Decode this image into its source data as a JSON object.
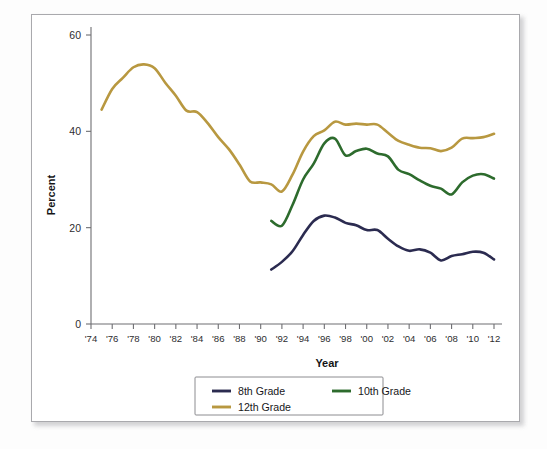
{
  "page": {
    "clipped_header_text": ""
  },
  "chart_data": {
    "type": "line",
    "title": "",
    "xlabel": "Year",
    "ylabel": "Percent",
    "ylim": [
      0,
      60
    ],
    "yticks": [
      0,
      20,
      40,
      60
    ],
    "ytick_labels": [
      "0",
      "20",
      "40",
      "60"
    ],
    "xlim": [
      1974,
      2012
    ],
    "xticks": [
      1974,
      1976,
      1978,
      1980,
      1982,
      1984,
      1986,
      1988,
      1990,
      1992,
      1994,
      1996,
      1998,
      2000,
      2002,
      2004,
      2006,
      2008,
      2010,
      2012
    ],
    "xtick_labels": [
      "'74",
      "'76",
      "'78",
      "'80",
      "'82",
      "'84",
      "'86",
      "'88",
      "'90",
      "'92",
      "'94",
      "'96",
      "'98",
      "'00",
      "'02",
      "'04",
      "'06",
      "'08",
      "'10",
      "'12"
    ],
    "grid": false,
    "legend_position": "bottom-center",
    "series": [
      {
        "name": "8th Grade",
        "color": "#2b2b50",
        "x": [
          1991,
          1992,
          1993,
          1994,
          1995,
          1996,
          1997,
          1998,
          1999,
          2000,
          2001,
          2002,
          2003,
          2004,
          2005,
          2006,
          2007,
          2008,
          2009,
          2010,
          2011,
          2012
        ],
        "values": [
          11.3,
          12.9,
          15.1,
          18.5,
          21.4,
          22.5,
          22.1,
          21.0,
          20.5,
          19.5,
          19.5,
          17.7,
          16.1,
          15.2,
          15.5,
          14.8,
          13.2,
          14.1,
          14.5,
          15.0,
          14.8,
          13.4
        ]
      },
      {
        "name": "10th Grade",
        "color": "#2d6b2d",
        "x": [
          1991,
          1992,
          1993,
          1994,
          1995,
          1996,
          1997,
          1998,
          1999,
          2000,
          2001,
          2002,
          2003,
          2004,
          2005,
          2006,
          2007,
          2008,
          2009,
          2010,
          2011,
          2012
        ],
        "values": [
          21.4,
          20.4,
          24.7,
          30.0,
          33.3,
          37.5,
          38.5,
          35.0,
          35.9,
          36.4,
          35.4,
          34.8,
          32.0,
          31.1,
          29.8,
          28.7,
          28.1,
          26.9,
          29.4,
          30.8,
          31.1,
          30.2
        ]
      },
      {
        "name": "12th Grade",
        "color": "#b89840",
        "x": [
          1975,
          1976,
          1977,
          1978,
          1979,
          1980,
          1981,
          1982,
          1983,
          1984,
          1985,
          1986,
          1987,
          1988,
          1989,
          1990,
          1991,
          1992,
          1993,
          1994,
          1995,
          1996,
          1997,
          1998,
          1999,
          2000,
          2001,
          2002,
          2003,
          2004,
          2005,
          2006,
          2007,
          2008,
          2009,
          2010,
          2011,
          2012
        ],
        "values": [
          44.5,
          48.8,
          51.1,
          53.3,
          53.9,
          53.1,
          50.1,
          47.4,
          44.3,
          44.0,
          41.7,
          38.8,
          36.3,
          33.1,
          29.6,
          29.4,
          29.0,
          27.5,
          31.0,
          35.8,
          39.0,
          40.2,
          42.0,
          41.4,
          41.6,
          41.4,
          41.4,
          39.7,
          38.0,
          37.2,
          36.6,
          36.5,
          35.9,
          36.6,
          38.5,
          38.6,
          38.8,
          39.5
        ]
      }
    ]
  },
  "legend": {
    "items": [
      {
        "label": "8th Grade",
        "color": "#2b2b50"
      },
      {
        "label": "10th Grade",
        "color": "#2d6b2d"
      },
      {
        "label": "12th Grade",
        "color": "#b89840"
      }
    ]
  }
}
